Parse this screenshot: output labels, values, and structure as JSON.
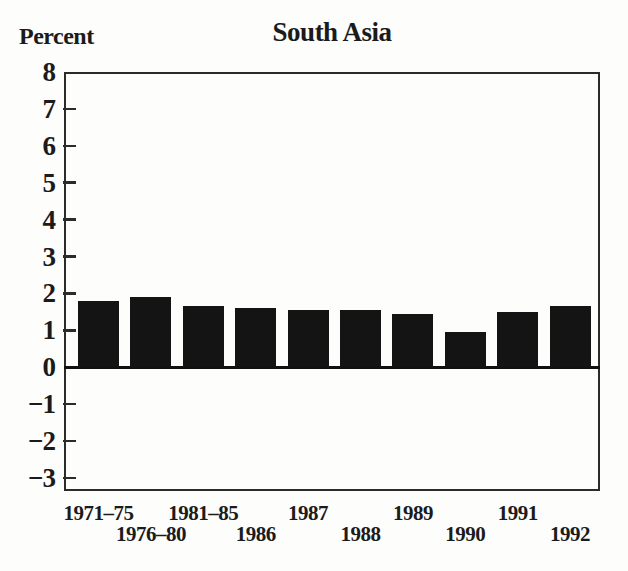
{
  "figure": {
    "background_color": "#fdfdfb",
    "bar_color": "#141414",
    "axis_color": "#2b2b2b",
    "text_color": "#1b1b1b"
  },
  "chart_data": {
    "type": "bar",
    "title": "South Asia",
    "ylabel": "Percent",
    "xlabel": "",
    "categories": [
      "1971–75",
      "1976–80",
      "1981–85",
      "1986",
      "1987",
      "1988",
      "1989",
      "1990",
      "1991",
      "1992"
    ],
    "values": [
      1.8,
      1.9,
      1.65,
      1.6,
      1.55,
      1.55,
      1.45,
      0.95,
      1.5,
      1.65
    ],
    "ylim": [
      -3.35,
      8
    ],
    "yticks": [
      8,
      7,
      6,
      5,
      4,
      3,
      2,
      1,
      0,
      -1,
      -2,
      -3
    ],
    "ytick_labels": [
      "8",
      "7",
      "6",
      "5",
      "4",
      "3",
      "2",
      "1",
      "0",
      "−1",
      "−2",
      "−3"
    ],
    "zero_baseline": true,
    "grid": false,
    "legend": null,
    "x_label_layout": "staggered-two-rows"
  }
}
